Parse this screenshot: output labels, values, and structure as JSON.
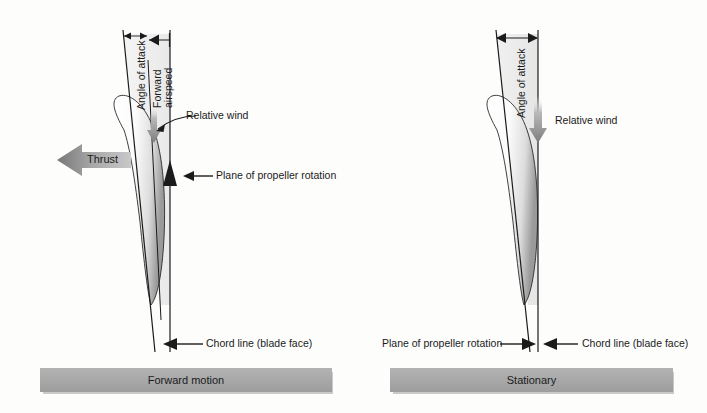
{
  "figure": {
    "background_color": "#fdfdfc",
    "line_color": "#1b1b1b",
    "bar_color": "#a8a8a8",
    "arrow_gray": "#8c8c8c"
  },
  "panels": [
    {
      "id": "forward-motion",
      "caption": "Forward motion",
      "labels": {
        "angle_of_attack": "Angle of attack",
        "forward_airspeed_line1": "Forward",
        "forward_airspeed_line2": "airspeed",
        "relative_wind": "Relative wind",
        "plane_of_rotation": "Plane of propeller rotation",
        "chord_line": "Chord line (blade face)",
        "thrust": "Thrust"
      }
    },
    {
      "id": "stationary",
      "caption": "Stationary",
      "labels": {
        "angle_of_attack": "Angle of attack",
        "relative_wind": "Relative wind",
        "plane_of_rotation": "Plane of propeller rotation",
        "chord_line": "Chord line (blade face)"
      }
    }
  ]
}
